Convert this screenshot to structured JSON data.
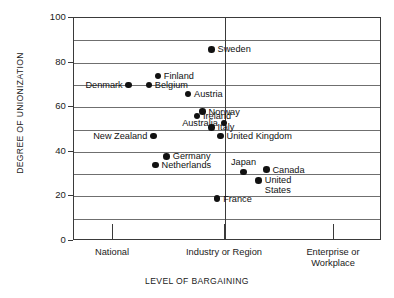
{
  "chart_data": {
    "type": "scatter",
    "title": "",
    "xlabel": "LEVEL OF BARGAINING",
    "ylabel": "DEGREE OF UNIONIZATION",
    "ylim": [
      0,
      100
    ],
    "yticks": [
      0,
      20,
      40,
      60,
      80,
      100
    ],
    "ytick_labels": [
      "0",
      "20",
      "40",
      "60",
      "80",
      "100"
    ],
    "gridlines": [
      10,
      20,
      30,
      40,
      50,
      60,
      70,
      80,
      90
    ],
    "grid": true,
    "legend": "none",
    "x_categories": [
      "National",
      "Industry or Region",
      "Enterprise or Workplace"
    ],
    "xtick_labels": [
      {
        "line1": "National",
        "line2": ""
      },
      {
        "line1": "Industry or Region",
        "line2": ""
      },
      {
        "line1": "Enterprise or",
        "line2": "Workplace"
      }
    ],
    "points": [
      {
        "name": "Sweden",
        "x": 0.88,
        "y": 86,
        "label_side": "right",
        "label_lines": [
          "Sweden"
        ]
      },
      {
        "name": "Denmark",
        "x": 1.14,
        "y": 70,
        "label_side": "left",
        "label_lines": [
          "Denmark"
        ]
      },
      {
        "name": "Finland",
        "x": 1.4,
        "y": 74,
        "label_side": "right",
        "label_lines": [
          "Finland"
        ]
      },
      {
        "name": "Belgium",
        "x": 1.32,
        "y": 70,
        "label_side": "right",
        "label_lines": [
          "Belgium"
        ]
      },
      {
        "name": "Austria",
        "x": 0.67,
        "y": 66,
        "label_side": "right",
        "label_lines": [
          "Austria"
        ]
      },
      {
        "name": "Norway",
        "x": 0.8,
        "y": 58,
        "label_side": "right",
        "label_lines": [
          "Norway"
        ]
      },
      {
        "name": "Australia",
        "x": 0.99,
        "y": 53,
        "label_side": "left",
        "label_lines": [
          "Australia"
        ]
      },
      {
        "name": "Ireland",
        "x": 1.75,
        "y": 56,
        "label_side": "right",
        "label_lines": [
          "Ireland"
        ]
      },
      {
        "name": "Italy",
        "x": 1.88,
        "y": 51,
        "label_side": "right",
        "label_lines": [
          "Italy"
        ]
      },
      {
        "name": "New Zealand",
        "x": 1.36,
        "y": 47,
        "label_side": "left",
        "label_lines": [
          "New Zealand"
        ]
      },
      {
        "name": "United Kingdom",
        "x": 1.96,
        "y": 47,
        "label_side": "right",
        "label_lines": [
          "United Kingdom"
        ]
      },
      {
        "name": "Germany",
        "x": 1.48,
        "y": 38,
        "label_side": "right",
        "label_lines": [
          "Germany"
        ]
      },
      {
        "name": "Netherlands",
        "x": 1.38,
        "y": 34,
        "label_side": "right",
        "label_lines": [
          "Netherlands"
        ]
      },
      {
        "name": "Japan",
        "x": 2.17,
        "y": 31,
        "label_side": "above",
        "label_lines": [
          "Japan"
        ]
      },
      {
        "name": "Canada",
        "x": 2.38,
        "y": 32,
        "label_side": "right",
        "label_lines": [
          "Canada"
        ]
      },
      {
        "name": "United States",
        "x": 2.31,
        "y": 27,
        "label_side": "right",
        "label_lines": [
          "United",
          "States"
        ]
      },
      {
        "name": "France",
        "x": 1.93,
        "y": 19,
        "label_side": "right",
        "label_lines": [
          "France"
        ]
      }
    ]
  }
}
